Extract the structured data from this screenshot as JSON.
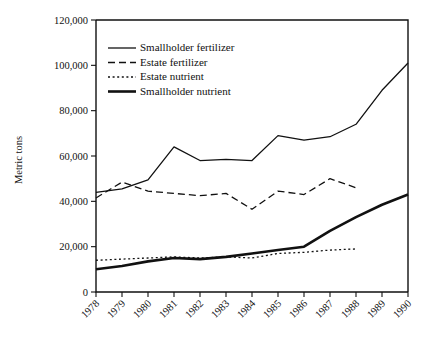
{
  "chart_data": {
    "type": "line",
    "title": "",
    "xlabel": "",
    "ylabel": "Metric tons",
    "x": [
      1978,
      1979,
      1980,
      1981,
      1982,
      1983,
      1984,
      1985,
      1986,
      1987,
      1988,
      1989,
      1990
    ],
    "xtick_labels": [
      "1978",
      "1979",
      "1980",
      "1981",
      "1982",
      "1983",
      "1984",
      "1985",
      "1986",
      "1987",
      "1988",
      "1989",
      "1990"
    ],
    "ytick_labels": [
      "0",
      "20,000",
      "40,000",
      "60,000",
      "80,000",
      "100,000",
      "120,000"
    ],
    "ytick_values": [
      0,
      20000,
      40000,
      60000,
      80000,
      100000,
      120000
    ],
    "xlim": [
      1978,
      1990
    ],
    "ylim": [
      0,
      120000
    ],
    "grid": false,
    "legend_position": "upper-left-inside",
    "series": [
      {
        "name": "Smallholder fertilizer",
        "style": "solid-thin",
        "values": [
          44000,
          45500,
          49500,
          64000,
          58000,
          58500,
          58000,
          69000,
          67000,
          68500,
          74000,
          89000,
          101000
        ]
      },
      {
        "name": "Estate fertilizer",
        "style": "dashed",
        "values": [
          41500,
          48500,
          44500,
          43500,
          42500,
          43500,
          36500,
          44500,
          43000,
          50000,
          46000,
          null,
          null
        ]
      },
      {
        "name": "Estate nutrient",
        "style": "dotted",
        "values": [
          14000,
          14500,
          15000,
          15500,
          15000,
          15500,
          15000,
          17000,
          17500,
          18500,
          19000,
          null,
          null
        ]
      },
      {
        "name": "Smallholder nutrient",
        "style": "solid-thick",
        "values": [
          10000,
          11500,
          13500,
          15000,
          14500,
          15500,
          17000,
          18500,
          20000,
          27000,
          33000,
          38500,
          43000
        ]
      }
    ]
  },
  "legend": {
    "entries": [
      {
        "label": "Smallholder fertilizer",
        "style": "solid-thin"
      },
      {
        "label": "Estate fertilizer",
        "style": "dashed"
      },
      {
        "label": "Estate nutrient",
        "style": "dotted"
      },
      {
        "label": "Smallholder nutrient",
        "style": "solid-thick"
      }
    ]
  },
  "colors": {
    "ink": "#111111",
    "background": "#ffffff"
  }
}
